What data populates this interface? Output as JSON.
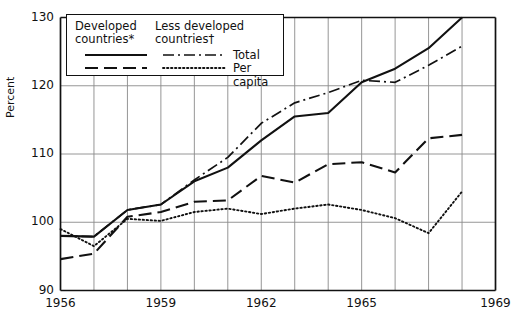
{
  "chart_data": {
    "type": "line",
    "title": "",
    "xlabel": "",
    "ylabel": "Percent",
    "xlim": [
      1956,
      1969
    ],
    "ylim": [
      90,
      130
    ],
    "xticks": [
      1956,
      1959,
      1962,
      1965,
      1969
    ],
    "yticks": [
      90,
      100,
      110,
      120,
      130
    ],
    "grid": true,
    "gridlines_x": [
      1956,
      1957,
      1958,
      1959,
      1960,
      1961,
      1962,
      1963,
      1964,
      1965,
      1966,
      1967,
      1968,
      1969
    ],
    "legend_position": "top-left",
    "legend": {
      "heading_left": "Developed countries*",
      "heading_right": "Less developed countries†",
      "entries": [
        {
          "label": "Total",
          "style": "solid",
          "group": "developed"
        },
        {
          "label": "Per capita",
          "style": "dashed",
          "group": "developed"
        },
        {
          "label": "Total",
          "style": "dashdot",
          "group": "less-developed"
        },
        {
          "label": "Per capita",
          "style": "dotted",
          "group": "less-developed"
        }
      ]
    },
    "x": [
      1956,
      1957,
      1958,
      1959,
      1960,
      1961,
      1962,
      1963,
      1964,
      1965,
      1966,
      1967,
      1968
    ],
    "series": [
      {
        "name": "Developed countries* Total",
        "style": "solid",
        "values": [
          98.0,
          97.9,
          101.8,
          102.6,
          106.0,
          108.0,
          112.0,
          115.5,
          116.0,
          120.5,
          122.5,
          125.5,
          130.0
        ]
      },
      {
        "name": "Developed countries* Per capita",
        "style": "dashed",
        "values": [
          94.6,
          95.4,
          100.8,
          101.5,
          103.0,
          103.2,
          106.8,
          105.8,
          108.5,
          108.8,
          107.3,
          112.3,
          112.8
        ]
      },
      {
        "name": "Less developed countries† Total",
        "style": "dashdot",
        "values": [
          98.0,
          97.9,
          101.8,
          102.6,
          106.2,
          109.5,
          114.5,
          117.5,
          119.0,
          120.8,
          120.5,
          123.0,
          125.8
        ]
      },
      {
        "name": "Less developed countries† Per capita",
        "style": "dotted",
        "values": [
          99.0,
          96.5,
          100.5,
          100.2,
          101.5,
          102.0,
          101.2,
          102.0,
          102.6,
          101.8,
          100.6,
          98.4,
          104.5
        ]
      }
    ]
  },
  "axis": {
    "ylabel": "Percent",
    "yticks": [
      "130",
      "120",
      "110",
      "100",
      "90"
    ],
    "xticks": [
      "1956",
      "1959",
      "1962",
      "1965",
      "1969"
    ]
  },
  "legend": {
    "heading_left_line1": "Developed",
    "heading_left_line2": "countries*",
    "heading_right_line1": "Less developed",
    "heading_right_line2": "countries†",
    "entry_total": "Total",
    "entry_percapita": "Per capita"
  },
  "colors": {
    "ink": "#111111",
    "grid": "#8a8a8a",
    "background": "#ffffff"
  }
}
